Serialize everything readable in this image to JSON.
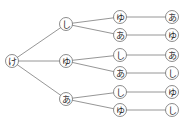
{
  "diagram": {
    "type": "tree-diagram",
    "root": {
      "id": "n0",
      "label": "け",
      "x": 12,
      "y": 61
    },
    "nodes": [
      {
        "id": "n1",
        "label": "し",
        "x": 66,
        "y": 24,
        "parent": "n0"
      },
      {
        "id": "n2",
        "label": "ゆ",
        "x": 66,
        "y": 61,
        "parent": "n0"
      },
      {
        "id": "n3",
        "label": "あ",
        "x": 66,
        "y": 99,
        "parent": "n0"
      },
      {
        "id": "n4",
        "label": "ゆ",
        "x": 120,
        "y": 17,
        "parent": "n1"
      },
      {
        "id": "n5",
        "label": "あ",
        "x": 120,
        "y": 35,
        "parent": "n1"
      },
      {
        "id": "n6",
        "label": "し",
        "x": 120,
        "y": 55,
        "parent": "n2"
      },
      {
        "id": "n7",
        "label": "あ",
        "x": 120,
        "y": 73,
        "parent": "n2"
      },
      {
        "id": "n8",
        "label": "し",
        "x": 120,
        "y": 92,
        "parent": "n3"
      },
      {
        "id": "n9",
        "label": "ゆ",
        "x": 120,
        "y": 110,
        "parent": "n3"
      },
      {
        "id": "n10",
        "label": "あ",
        "x": 172,
        "y": 17,
        "parent": "n4"
      },
      {
        "id": "n11",
        "label": "ゆ",
        "x": 172,
        "y": 35,
        "parent": "n5"
      },
      {
        "id": "n12",
        "label": "あ",
        "x": 172,
        "y": 55,
        "parent": "n6"
      },
      {
        "id": "n13",
        "label": "し",
        "x": 172,
        "y": 73,
        "parent": "n7"
      },
      {
        "id": "n14",
        "label": "ゆ",
        "x": 172,
        "y": 92,
        "parent": "n8"
      },
      {
        "id": "n15",
        "label": "し",
        "x": 172,
        "y": 110,
        "parent": "n9"
      }
    ],
    "node_radius": 6.5,
    "colors": {
      "edge": "#8a8a8a",
      "node_stroke": "#6f6f6f",
      "node_fill": "#ffffff",
      "label": "#2a2a2a"
    }
  }
}
